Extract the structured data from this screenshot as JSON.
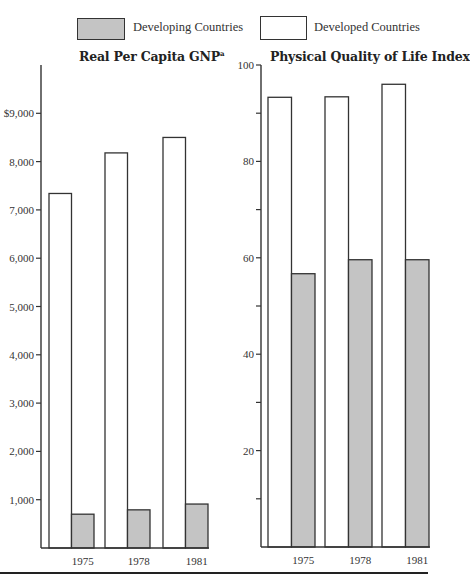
{
  "legend": {
    "items": [
      {
        "label": "Developing Countries",
        "color": "#c4c4c4"
      },
      {
        "label": "Developed Countries",
        "color": "#ffffff"
      }
    ]
  },
  "chart_data": [
    {
      "type": "bar",
      "title": "Real Per Capita GNP",
      "title_footnote": "a",
      "categories": [
        "1975",
        "1978",
        "1981"
      ],
      "series": [
        {
          "name": "Developed Countries",
          "values": [
            7340,
            8180,
            8500
          ],
          "color": "#ffffff"
        },
        {
          "name": "Developing Countries",
          "values": [
            700,
            790,
            910
          ],
          "color": "#c4c4c4"
        }
      ],
      "xlabel": "",
      "ylabel": "",
      "ylim": [
        0,
        10000
      ],
      "yticks": [
        1000,
        2000,
        3000,
        4000,
        5000,
        6000,
        7000,
        8000,
        9000
      ],
      "ytick_labels": [
        "1,000",
        "2,000",
        "3,000",
        "4,000",
        "5,000",
        "6,000",
        "7,000",
        "8,000",
        "$9,000"
      ],
      "grid": false,
      "legend_position": "top"
    },
    {
      "type": "bar",
      "title": "Physical Quality of Life Index",
      "categories": [
        "1975",
        "1978",
        "1981"
      ],
      "series": [
        {
          "name": "Developed Countries",
          "values": [
            93.3,
            93.4,
            96.0
          ],
          "color": "#ffffff"
        },
        {
          "name": "Developing Countries",
          "values": [
            56.7,
            59.6,
            59.6
          ],
          "color": "#c4c4c4"
        }
      ],
      "xlabel": "",
      "ylabel": "",
      "ylim": [
        0,
        100
      ],
      "yticks": [
        10,
        20,
        30,
        40,
        50,
        60,
        70,
        80,
        90,
        100
      ],
      "ytick_labels": [
        "",
        "20",
        "",
        "40",
        "",
        "60",
        "",
        "80",
        "",
        "100"
      ],
      "grid": false,
      "legend_position": "top"
    }
  ]
}
